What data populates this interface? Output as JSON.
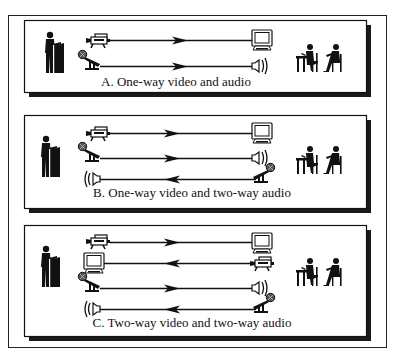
{
  "figure": {
    "panels": [
      {
        "id": "A",
        "caption": "A.  One-way video and audio",
        "channels": [
          {
            "type": "video",
            "from": "camera",
            "to": "monitor",
            "direction": "right"
          },
          {
            "type": "audio",
            "from": "microphone",
            "to": "speaker",
            "direction": "right"
          }
        ]
      },
      {
        "id": "B",
        "caption": "B.  One-way video and two-way audio",
        "channels": [
          {
            "type": "video",
            "from": "camera",
            "to": "monitor",
            "direction": "right"
          },
          {
            "type": "audio",
            "from": "microphone",
            "to": "speaker",
            "direction": "right"
          },
          {
            "type": "audio",
            "from": "microphone",
            "to": "speaker",
            "direction": "left"
          }
        ]
      },
      {
        "id": "C",
        "caption": "C.  Two-way video and two-way audio",
        "channels": [
          {
            "type": "video",
            "from": "camera",
            "to": "monitor",
            "direction": "right"
          },
          {
            "type": "video",
            "from": "camera",
            "to": "monitor",
            "direction": "left"
          },
          {
            "type": "audio",
            "from": "microphone",
            "to": "speaker",
            "direction": "right"
          },
          {
            "type": "audio",
            "from": "microphone",
            "to": "speaker",
            "direction": "left"
          }
        ]
      }
    ],
    "icons": {
      "presenter": "presenter-at-podium-icon",
      "audience": "seated-students-icon",
      "camera": "video-camera-icon",
      "monitor": "monitor-icon",
      "microphone": "microphone-icon",
      "speaker": "speaker-icon"
    },
    "colors": {
      "ink": "#111111",
      "background": "#ffffff",
      "shadow": "#1a1a1a"
    }
  }
}
